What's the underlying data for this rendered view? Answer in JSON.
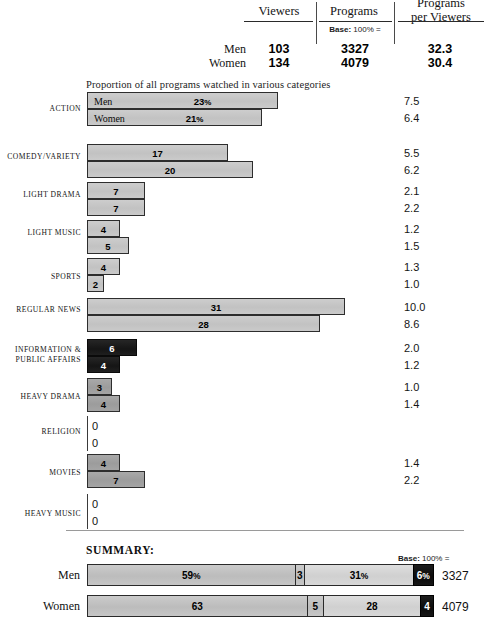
{
  "header": {
    "columns": [
      "Viewers",
      "Programs",
      "Programs per Viewers"
    ],
    "col_viewers": "Viewers",
    "col_programs": "Programs",
    "col_ppv_line1": "Programs",
    "col_ppv_line2": "per Viewers",
    "base_note_bold": "Base:",
    "base_note_rest": " 100% =",
    "rows": [
      {
        "label": "Men",
        "viewers": "103",
        "programs": "3327",
        "ppv": "32.3"
      },
      {
        "label": "Women",
        "viewers": "134",
        "programs": "4079",
        "ppv": "30.4"
      }
    ]
  },
  "caption": "Proportion of all programs watched in various categories",
  "series_names": {
    "men": "Men",
    "women": "Women"
  },
  "chart_data": {
    "type": "bar",
    "title": "Proportion of all programs watched in various categories",
    "orientation": "horizontal",
    "xlabel": "",
    "ylabel": "",
    "xlim": [
      0,
      35
    ],
    "grid": false,
    "legend_position": "inline-first-bars",
    "unit": "percent",
    "categories": [
      "ACTION",
      "COMEDY/VARIETY",
      "LIGHT DRAMA",
      "LIGHT MUSIC",
      "SPORTS",
      "REGULAR NEWS",
      "INFORMATION & PUBLIC AFFAIRS",
      "HEAVY DRAMA",
      "RELIGION",
      "MOVIES",
      "HEAVY MUSIC"
    ],
    "series": [
      {
        "name": "Men",
        "values": [
          23,
          17,
          7,
          4,
          4,
          31,
          6,
          3,
          0,
          4,
          0
        ]
      },
      {
        "name": "Women",
        "values": [
          21,
          20,
          7,
          5,
          2,
          28,
          4,
          4,
          0,
          7,
          0
        ]
      }
    ],
    "ratio_series": [
      {
        "name": "Men",
        "values": [
          7.5,
          5.5,
          2.1,
          1.2,
          1.3,
          10.0,
          2.0,
          1.0,
          null,
          1.4,
          null
        ]
      },
      {
        "name": "Women",
        "values": [
          6.4,
          6.2,
          2.2,
          1.5,
          1.0,
          8.6,
          1.2,
          1.4,
          null,
          2.2,
          null
        ]
      }
    ],
    "shades": [
      "light",
      "light",
      "light",
      "light",
      "light",
      "light",
      "dark",
      "mid",
      "none",
      "mid",
      "none"
    ],
    "colors": {
      "light": "#c7c7c7",
      "mid": "#a2a2a2",
      "dark": "#1d1d1d",
      "outline": "#2d2d2d"
    }
  },
  "rows": [
    {
      "label": "ACTION",
      "shade": "light",
      "named": true,
      "men": {
        "name": "Men",
        "value": 23,
        "display": "23",
        "suffix": "%",
        "ratio": "7.5"
      },
      "women": {
        "name": "Women",
        "value": 21,
        "display": "21",
        "suffix": "%",
        "ratio": "6.4"
      }
    },
    {
      "label": "COMEDY/VARIETY",
      "shade": "light",
      "named": false,
      "men": {
        "value": 17,
        "display": "17",
        "suffix": "",
        "ratio": "5.5"
      },
      "women": {
        "value": 20,
        "display": "20",
        "suffix": "",
        "ratio": "6.2"
      }
    },
    {
      "label": "LIGHT DRAMA",
      "shade": "light",
      "named": false,
      "men": {
        "value": 7,
        "display": "7",
        "suffix": "",
        "ratio": "2.1"
      },
      "women": {
        "value": 7,
        "display": "7",
        "suffix": "",
        "ratio": "2.2"
      }
    },
    {
      "label": "LIGHT MUSIC",
      "shade": "light",
      "named": false,
      "men": {
        "value": 4,
        "display": "4",
        "suffix": "",
        "ratio": "1.2"
      },
      "women": {
        "value": 5,
        "display": "5",
        "suffix": "",
        "ratio": "1.5"
      }
    },
    {
      "label": "SPORTS",
      "shade": "light",
      "named": false,
      "men": {
        "value": 4,
        "display": "4",
        "suffix": "",
        "ratio": "1.3"
      },
      "women": {
        "value": 2,
        "display": "2",
        "suffix": "",
        "ratio": "1.0"
      }
    },
    {
      "label": "REGULAR NEWS",
      "shade": "light",
      "named": false,
      "men": {
        "value": 31,
        "display": "31",
        "suffix": "",
        "ratio": "10.0"
      },
      "women": {
        "value": 28,
        "display": "28",
        "suffix": "",
        "ratio": "8.6"
      }
    },
    {
      "label": "INFORMATION & PUBLIC AFFAIRS",
      "label_line1": "INFORMATION &",
      "label_line2": "PUBLIC AFFAIRS",
      "shade": "dark",
      "named": false,
      "men": {
        "value": 6,
        "display": "6",
        "suffix": "",
        "ratio": "2.0"
      },
      "women": {
        "value": 4,
        "display": "4",
        "suffix": "",
        "ratio": "1.2"
      }
    },
    {
      "label": "HEAVY DRAMA",
      "shade": "mid",
      "named": false,
      "men": {
        "value": 3,
        "display": "3",
        "suffix": "",
        "ratio": "1.0"
      },
      "women": {
        "value": 4,
        "display": "4",
        "suffix": "",
        "ratio": "1.4"
      }
    },
    {
      "label": "RELIGION",
      "shade": "none",
      "named": false,
      "zero": true,
      "men": {
        "value": 0,
        "display": "0",
        "suffix": "",
        "ratio": ""
      },
      "women": {
        "value": 0,
        "display": "0",
        "suffix": "",
        "ratio": ""
      }
    },
    {
      "label": "MOVIES",
      "shade": "mid",
      "named": false,
      "men": {
        "value": 4,
        "display": "4",
        "suffix": "",
        "ratio": "1.4"
      },
      "women": {
        "value": 7,
        "display": "7",
        "suffix": "",
        "ratio": "2.2"
      }
    },
    {
      "label": "HEAVY MUSIC",
      "shade": "none",
      "named": false,
      "zero": true,
      "men": {
        "value": 0,
        "display": "0",
        "suffix": "",
        "ratio": ""
      },
      "women": {
        "value": 0,
        "display": "0",
        "suffix": "",
        "ratio": ""
      }
    }
  ],
  "summary": {
    "title": "SUMMARY:",
    "base_note_bold": "Base:",
    "base_note_rest": " 100% =",
    "rows": [
      {
        "label": "Men",
        "total": "3327",
        "segments": [
          {
            "value": 59,
            "display": "59",
            "suffix": "%",
            "shade": "mid"
          },
          {
            "value": 3,
            "display": "3",
            "suffix": "",
            "shade": "mid"
          },
          {
            "value": 31,
            "display": "31",
            "suffix": "%",
            "shade": "light"
          },
          {
            "value": 6,
            "display": "6",
            "suffix": "%",
            "shade": "black"
          }
        ]
      },
      {
        "label": "Women",
        "total": "4079",
        "segments": [
          {
            "value": 63,
            "display": "63",
            "suffix": "",
            "shade": "mid"
          },
          {
            "value": 5,
            "display": "5",
            "suffix": "",
            "shade": "mid"
          },
          {
            "value": 28,
            "display": "28",
            "suffix": "",
            "shade": "light"
          },
          {
            "value": 4,
            "display": "4",
            "suffix": "",
            "shade": "black"
          }
        ]
      }
    ]
  }
}
